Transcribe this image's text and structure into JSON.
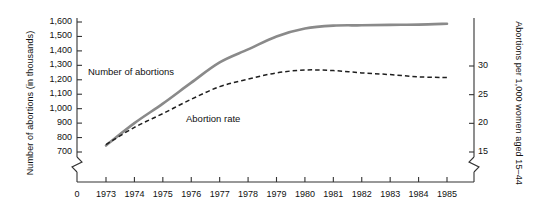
{
  "chart_data": {
    "type": "line",
    "title": "",
    "xlabel": "",
    "x": [
      1973,
      1974,
      1975,
      1976,
      1977,
      1978,
      1979,
      1980,
      1981,
      1982,
      1983,
      1984,
      1985
    ],
    "x_tick_labels": [
      "1973",
      "1974",
      "1975",
      "1976",
      "1977",
      "1978",
      "1979",
      "1980",
      "1981",
      "1982",
      "1983",
      "1984",
      "1985"
    ],
    "x_origin_label": "0",
    "grid": false,
    "legend_position": "inline-annotation",
    "axis_break": true,
    "left_axis": {
      "label": "Number of abortions  (in thousands)",
      "ticks": [
        700,
        800,
        900,
        1000,
        1100,
        1200,
        1300,
        1400,
        1500,
        1600
      ],
      "tick_labels": [
        "700",
        "800",
        "900",
        "1,000",
        "1,100",
        "1,200",
        "1,300",
        "1,400",
        "1,500",
        "1,600"
      ],
      "ylim": [
        660,
        1640
      ]
    },
    "right_axis": {
      "label": "Abortions per 1,000 women aged 15–44",
      "ticks": [
        15,
        20,
        25,
        30
      ],
      "tick_labels": [
        "15",
        "20",
        "25",
        "30"
      ],
      "ylim": [
        13.6,
        33.2
      ]
    },
    "series": [
      {
        "name": "Number of abortions",
        "axis": "left",
        "style": "solid",
        "color": "#8a8a8a",
        "values": [
          745,
          900,
          1035,
          1180,
          1320,
          1410,
          1500,
          1555,
          1575,
          1577,
          1580,
          1582,
          1588
        ]
      },
      {
        "name": "Abortion rate",
        "axis": "right",
        "style": "dashed",
        "color": "#1f1f1f",
        "values": [
          16.3,
          19.3,
          21.7,
          24.2,
          26.4,
          27.7,
          28.8,
          29.3,
          29.2,
          28.8,
          28.5,
          28.1,
          28.0
        ]
      }
    ]
  },
  "annotations": {
    "number_of_abortions": "Number of abortions",
    "abortion_rate": "Abortion rate"
  }
}
